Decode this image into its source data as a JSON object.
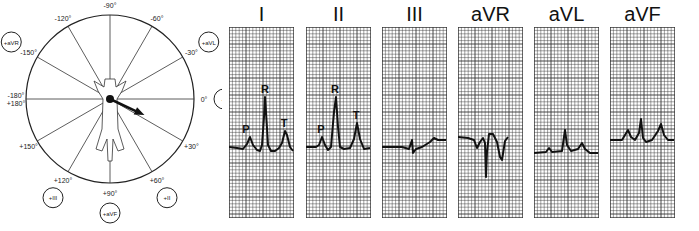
{
  "hexaxial": {
    "angle_labels": [
      {
        "text": "-90°",
        "angle": -90
      },
      {
        "text": "-60°",
        "angle": -60
      },
      {
        "text": "-30°",
        "angle": -30
      },
      {
        "text": "0°",
        "angle": 0
      },
      {
        "text": "+30°",
        "angle": 30
      },
      {
        "text": "+60°",
        "angle": 60
      },
      {
        "text": "+90°",
        "angle": 90
      },
      {
        "text": "+120°",
        "angle": 120
      },
      {
        "text": "+150°",
        "angle": 150
      },
      {
        "text": "-180° +180°",
        "angle": 180
      },
      {
        "text": "-150°",
        "angle": -150
      },
      {
        "text": "-120°",
        "angle": -120
      }
    ],
    "lead_markers": [
      {
        "text": "+aVR",
        "angle": -150
      },
      {
        "text": "+aVL",
        "angle": -30
      },
      {
        "text": "+I",
        "angle": 0
      },
      {
        "text": "+II",
        "angle": 60
      },
      {
        "text": "+aVF",
        "angle": 90
      },
      {
        "text": "+III",
        "angle": 120
      }
    ],
    "mean_axis_angle": 25
  },
  "leads": [
    {
      "label": "I",
      "waves": [
        "P",
        "R",
        "T"
      ]
    },
    {
      "label": "II",
      "waves": [
        "P",
        "R",
        "T"
      ]
    },
    {
      "label": "III",
      "waves": []
    },
    {
      "label": "aVR",
      "waves": []
    },
    {
      "label": "aVL",
      "waves": []
    },
    {
      "label": "aVF",
      "waves": []
    }
  ]
}
